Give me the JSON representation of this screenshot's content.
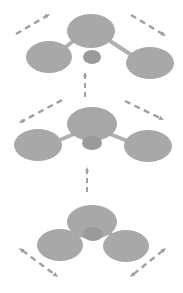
{
  "figure": {
    "background_color": "#ffffff",
    "node_color": "#a8a8a8",
    "small_node_color": "#9a9a9a",
    "bond_color": "#b0b0b0",
    "arrow_color": "#a0a0a0",
    "canvas": {
      "width": 183,
      "height": 293
    }
  },
  "stages": [
    {
      "id": "stage-top",
      "label": "stage-3-top",
      "order": 3,
      "nodes": [
        {
          "id": "top-parent",
          "name": "parent-node",
          "cx": 91,
          "cy": 31,
          "rx": 24,
          "ry": 17
        },
        {
          "id": "top-left-child",
          "name": "left-child-node",
          "cx": 49,
          "cy": 57,
          "rx": 23,
          "ry": 16
        },
        {
          "id": "top-right-child",
          "name": "right-child-node",
          "cx": 150,
          "cy": 63,
          "rx": 24,
          "ry": 16
        },
        {
          "id": "top-center-small",
          "name": "center-small-node",
          "cx": 92,
          "cy": 57,
          "rx": 9,
          "ry": 7
        }
      ],
      "bonds": [
        {
          "id": "top-bond-left",
          "name": "bond-parent-left",
          "x1": 72,
          "y1": 42,
          "x2": 62,
          "y2": 50
        },
        {
          "id": "top-bond-right",
          "name": "bond-parent-right",
          "x1": 110,
          "y1": 41,
          "x2": 133,
          "y2": 56
        }
      ],
      "arrows": [
        {
          "id": "top-arrow-left",
          "name": "motion-arrow-up-left",
          "direction": "up-right",
          "double": false,
          "x1": 16,
          "y1": 34,
          "x2": 50,
          "y2": 14
        },
        {
          "id": "top-arrow-right",
          "name": "motion-arrow-up-right",
          "direction": "down-right",
          "double": false,
          "x1": 131,
          "y1": 15,
          "x2": 166,
          "y2": 36
        }
      ]
    },
    {
      "id": "stage-middle",
      "label": "stage-2-middle",
      "order": 2,
      "nodes": [
        {
          "id": "mid-parent",
          "name": "parent-node",
          "cx": 92,
          "cy": 124,
          "rx": 25,
          "ry": 17
        },
        {
          "id": "mid-left-child",
          "name": "left-child-node",
          "cx": 38,
          "cy": 145,
          "rx": 24,
          "ry": 16
        },
        {
          "id": "mid-right-child",
          "name": "right-child-node",
          "cx": 148,
          "cy": 146,
          "rx": 24,
          "ry": 16
        },
        {
          "id": "mid-center-small",
          "name": "center-small-node",
          "cx": 92,
          "cy": 143,
          "rx": 10,
          "ry": 7
        }
      ],
      "bonds": [
        {
          "id": "mid-bond-left",
          "name": "bond-parent-left",
          "x1": 74,
          "y1": 134,
          "x2": 55,
          "y2": 142
        },
        {
          "id": "mid-bond-right",
          "name": "bond-parent-right",
          "x1": 110,
          "y1": 134,
          "x2": 130,
          "y2": 142
        }
      ],
      "arrows": [
        {
          "id": "mid-arrow-left",
          "name": "motion-arrow-mid-left",
          "direction": "down-left",
          "double": false,
          "x1": 62,
          "y1": 100,
          "x2": 19,
          "y2": 123
        },
        {
          "id": "mid-arrow-right",
          "name": "motion-arrow-mid-right",
          "direction": "down-right",
          "double": false,
          "x1": 125,
          "y1": 101,
          "x2": 164,
          "y2": 120
        }
      ]
    },
    {
      "id": "stage-bottom",
      "label": "stage-1-bottom",
      "order": 1,
      "nodes": [
        {
          "id": "bot-parent",
          "name": "parent-node",
          "cx": 92,
          "cy": 222,
          "rx": 25,
          "ry": 17
        },
        {
          "id": "bot-left-child",
          "name": "left-child-node",
          "cx": 60,
          "cy": 245,
          "rx": 23,
          "ry": 16
        },
        {
          "id": "bot-right-child",
          "name": "right-child-node",
          "cx": 126,
          "cy": 246,
          "rx": 23,
          "ry": 16
        },
        {
          "id": "bot-center-small",
          "name": "center-small-node",
          "cx": 93,
          "cy": 234,
          "rx": 10,
          "ry": 7
        }
      ],
      "bonds": [
        {
          "id": "bot-bond-left",
          "name": "bond-parent-left",
          "x1": 78,
          "y1": 231,
          "x2": 69,
          "y2": 239
        },
        {
          "id": "bot-bond-right",
          "name": "bond-parent-right",
          "x1": 107,
          "y1": 231,
          "x2": 117,
          "y2": 239
        }
      ],
      "arrows": [
        {
          "id": "bot-arrow-left",
          "name": "motion-arrow-bottom-left",
          "direction": "up-left-down-right",
          "double": true,
          "x1": 19,
          "y1": 248,
          "x2": 58,
          "y2": 277
        },
        {
          "id": "bot-arrow-right",
          "name": "motion-arrow-bottom-right",
          "direction": "up-right-down-left",
          "double": true,
          "x1": 166,
          "y1": 248,
          "x2": 130,
          "y2": 277
        }
      ]
    }
  ],
  "transitions": [
    {
      "id": "transition-bottom-to-middle",
      "name": "stage-transition-arrow-up-lower",
      "direction": "up",
      "x": 87,
      "y1": 192,
      "y2": 167
    },
    {
      "id": "transition-middle-to-top",
      "name": "stage-transition-arrow-up-upper",
      "direction": "up",
      "x": 85,
      "y1": 97,
      "y2": 72
    }
  ]
}
